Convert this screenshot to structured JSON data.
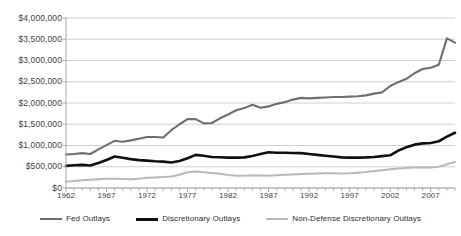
{
  "chart_data": {
    "type": "line",
    "title": "",
    "xlabel": "",
    "ylabel": "",
    "xlim": [
      1962,
      2010
    ],
    "ylim": [
      0,
      4000000
    ],
    "grid": true,
    "legend_position": "bottom",
    "y_tick_labels": [
      "$4,000,000",
      "$3,500,000",
      "$3,000,000",
      "$2,500,000",
      "$2,000,000",
      "$1,500,000",
      "$1,000,000",
      "$500,000",
      "$0"
    ],
    "y_tick_values": [
      4000000,
      3500000,
      3000000,
      2500000,
      2000000,
      1500000,
      1000000,
      500000,
      0
    ],
    "x_tick_labels": [
      "1962",
      "1967",
      "1972",
      "1977",
      "1982",
      "1987",
      "1992",
      "1997",
      "2002",
      "2007"
    ],
    "x_tick_values": [
      1962,
      1967,
      1972,
      1977,
      1982,
      1987,
      1992,
      1997,
      2002,
      2007
    ],
    "x": [
      1962,
      1963,
      1964,
      1965,
      1966,
      1967,
      1968,
      1969,
      1970,
      1971,
      1972,
      1973,
      1974,
      1975,
      1976,
      1977,
      1978,
      1979,
      1980,
      1981,
      1982,
      1983,
      1984,
      1985,
      1986,
      1987,
      1988,
      1989,
      1990,
      1991,
      1992,
      1993,
      1994,
      1995,
      1996,
      1997,
      1998,
      1999,
      2000,
      2001,
      2002,
      2003,
      2004,
      2005,
      2006,
      2007,
      2008,
      2009,
      2010
    ],
    "series": [
      {
        "name": "Fed Outlays",
        "color": "#6e6e6e",
        "width": 2.1,
        "values": [
          790000,
          800000,
          820000,
          800000,
          910000,
          1010000,
          1110000,
          1090000,
          1120000,
          1160000,
          1200000,
          1200000,
          1190000,
          1360000,
          1500000,
          1620000,
          1620000,
          1520000,
          1530000,
          1640000,
          1730000,
          1830000,
          1880000,
          1960000,
          1890000,
          1920000,
          1980000,
          2020000,
          2080000,
          2120000,
          2110000,
          2120000,
          2130000,
          2140000,
          2140000,
          2150000,
          2160000,
          2180000,
          2220000,
          2250000,
          2400000,
          2490000,
          2570000,
          2700000,
          2800000,
          2830000,
          2900000,
          3520000,
          3420000
        ]
      },
      {
        "name": "Discretionary Outlays",
        "color": "#0f0f0f",
        "width": 2.6,
        "values": [
          520000,
          535000,
          545000,
          530000,
          590000,
          660000,
          740000,
          710000,
          680000,
          655000,
          645000,
          630000,
          620000,
          600000,
          635000,
          700000,
          780000,
          760000,
          730000,
          725000,
          715000,
          715000,
          720000,
          755000,
          800000,
          840000,
          830000,
          830000,
          825000,
          820000,
          800000,
          780000,
          760000,
          740000,
          720000,
          715000,
          715000,
          720000,
          730000,
          750000,
          770000,
          880000,
          960000,
          1020000,
          1050000,
          1060000,
          1100000,
          1210000,
          1300000
        ]
      },
      {
        "name": "Non-Defense Discretionary Outlays",
        "color": "#b9b9b9",
        "width": 2.0,
        "values": [
          150000,
          165000,
          180000,
          195000,
          205000,
          215000,
          220000,
          210000,
          205000,
          220000,
          240000,
          250000,
          260000,
          270000,
          310000,
          370000,
          390000,
          370000,
          355000,
          335000,
          305000,
          290000,
          290000,
          300000,
          295000,
          290000,
          300000,
          310000,
          320000,
          330000,
          335000,
          340000,
          345000,
          345000,
          340000,
          345000,
          360000,
          375000,
          400000,
          420000,
          440000,
          460000,
          470000,
          480000,
          480000,
          480000,
          500000,
          560000,
          610000
        ]
      }
    ]
  },
  "legend": {
    "items": [
      {
        "label": "Fed Outlays",
        "color": "#6e6e6e",
        "thickness": "2.2px"
      },
      {
        "label": "Discretionary Outlays",
        "color": "#0f0f0f",
        "thickness": "3px"
      },
      {
        "label": "Non-Defense Discretionary Outlays",
        "color": "#b9b9b9",
        "thickness": "2px"
      }
    ]
  },
  "axes": {
    "axis_color": "#a6a6a6",
    "grid_color": "#cfcfcf"
  }
}
